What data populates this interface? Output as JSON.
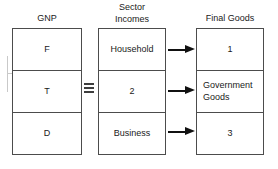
{
  "diagram": {
    "columns": [
      {
        "id": "gnp",
        "header": "GNP",
        "cells": [
          {
            "label": "F"
          },
          {
            "label": "T"
          },
          {
            "label": "D"
          }
        ]
      },
      {
        "id": "sector-incomes",
        "header": "Sector\nIncomes",
        "cells": [
          {
            "label": "Household"
          },
          {
            "label": "2"
          },
          {
            "label": "Business"
          }
        ]
      },
      {
        "id": "final-goods",
        "header": "Final Goods",
        "cells": [
          {
            "label": "1"
          },
          {
            "label": "Government\nGoods"
          },
          {
            "label": "3"
          }
        ]
      }
    ],
    "identity_symbol": {
      "name": "identity-equivalence-symbol",
      "glyph": "≡",
      "between": [
        "gnp",
        "sector-incomes"
      ]
    },
    "arrows": [
      {
        "from": "Household",
        "to": "1"
      },
      {
        "from": "2",
        "to": "Government Goods"
      },
      {
        "from": "Business",
        "to": "3"
      }
    ],
    "colors": {
      "background": "#ffffff",
      "box_border": "#4c4c4c",
      "text": "#1a1a1a",
      "arrow": "#111111",
      "artifact": "#c9c9c9"
    }
  }
}
